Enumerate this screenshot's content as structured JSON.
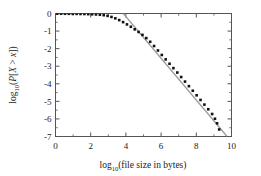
{
  "chart_data": {
    "type": "scatter",
    "title": "",
    "xlabel": "log10(file size in bytes)",
    "ylabel": "log10(P[X > x])",
    "xlabel_parts": {
      "base": "log",
      "sub": "10",
      "rest": "(file size in bytes)"
    },
    "ylabel_parts": {
      "base": "log",
      "sub": "10",
      "open": "(",
      "p": "P",
      "bracket_open": "[",
      "x_upper": "X",
      "gt": " > ",
      "x_lower": "x",
      "bracket_close": "]",
      "close": ")"
    },
    "xlim": [
      0,
      10
    ],
    "ylim": [
      -7,
      0
    ],
    "xticks": [
      0,
      2,
      4,
      6,
      8,
      10
    ],
    "yticks": [
      0,
      -1,
      -2,
      -3,
      -4,
      -5,
      -6,
      -7
    ],
    "xtick_labels": [
      "0",
      "2",
      "4",
      "6",
      "8",
      "10"
    ],
    "ytick_labels": [
      "0",
      "-1",
      "-2",
      "-3",
      "-4",
      "-5",
      "-6",
      "-7"
    ],
    "xminor_ticks": [
      1,
      3,
      5,
      7,
      9
    ],
    "yminor_ticks": [
      -0.5,
      -1.5,
      -2.5,
      -3.5,
      -4.5,
      -5.5,
      -6.5
    ],
    "grid": false,
    "legend": null,
    "marker_color": "#111111",
    "marker_shape": "square",
    "marker_size_px": 2.6,
    "frame_color": "#555555",
    "fit_line": {
      "name": "power-law reference line",
      "color": "#9a9a9a",
      "width_px": 1.2,
      "x": [
        3.85,
        9.75
      ],
      "y": [
        0.0,
        -7.0
      ],
      "slope": -1.1864,
      "intercept": 4.5676
    },
    "series": [
      {
        "name": "empirical CCDF of file sizes",
        "points": [
          {
            "x": 0.1,
            "y": -0.01
          },
          {
            "x": 0.32,
            "y": -0.012
          },
          {
            "x": 0.54,
            "y": -0.014
          },
          {
            "x": 0.76,
            "y": -0.016
          },
          {
            "x": 0.98,
            "y": -0.018
          },
          {
            "x": 1.2,
            "y": -0.022
          },
          {
            "x": 1.42,
            "y": -0.026
          },
          {
            "x": 1.64,
            "y": -0.03
          },
          {
            "x": 1.86,
            "y": -0.036
          },
          {
            "x": 2.08,
            "y": -0.044
          },
          {
            "x": 2.3,
            "y": -0.054
          },
          {
            "x": 2.52,
            "y": -0.07
          },
          {
            "x": 2.74,
            "y": -0.095
          },
          {
            "x": 2.96,
            "y": -0.135
          },
          {
            "x": 3.18,
            "y": -0.195
          },
          {
            "x": 3.4,
            "y": -0.275
          },
          {
            "x": 3.62,
            "y": -0.375
          },
          {
            "x": 3.84,
            "y": -0.49
          },
          {
            "x": 4.06,
            "y": -0.62
          },
          {
            "x": 4.28,
            "y": -0.755
          },
          {
            "x": 4.5,
            "y": -0.9
          },
          {
            "x": 4.72,
            "y": -1.05
          },
          {
            "x": 4.94,
            "y": -1.215
          },
          {
            "x": 5.16,
            "y": -1.4
          },
          {
            "x": 5.38,
            "y": -1.61
          },
          {
            "x": 5.6,
            "y": -1.85
          },
          {
            "x": 5.82,
            "y": -2.105
          },
          {
            "x": 6.04,
            "y": -2.36
          },
          {
            "x": 6.26,
            "y": -2.61
          },
          {
            "x": 6.48,
            "y": -2.86
          },
          {
            "x": 6.7,
            "y": -3.11
          },
          {
            "x": 6.92,
            "y": -3.36
          },
          {
            "x": 7.14,
            "y": -3.615
          },
          {
            "x": 7.36,
            "y": -3.875
          },
          {
            "x": 7.58,
            "y": -4.135
          },
          {
            "x": 7.8,
            "y": -4.395
          },
          {
            "x": 8.02,
            "y": -4.655
          },
          {
            "x": 8.24,
            "y": -4.92
          },
          {
            "x": 8.46,
            "y": -5.185
          },
          {
            "x": 8.68,
            "y": -5.45
          },
          {
            "x": 8.9,
            "y": -5.72
          },
          {
            "x": 9.06,
            "y": -5.99
          },
          {
            "x": 9.18,
            "y": -6.25
          },
          {
            "x": 9.3,
            "y": -6.6
          }
        ]
      }
    ]
  }
}
